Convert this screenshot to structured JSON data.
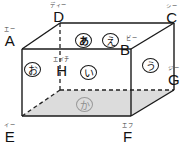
{
  "figure": {
    "kind": "rectangular-cuboid-diagram",
    "shape_name": "cuboid",
    "colors": {
      "stroke": "#1a1a1a",
      "hidden_stroke": "#222222",
      "bottom_face_fill": "#dcdcdc",
      "faint_stroke": "#9a9a9a",
      "background": "#ffffff"
    }
  },
  "vertices": [
    {
      "id": "A",
      "letter": "A",
      "furigana": "エー",
      "x": 16,
      "y": 27
    },
    {
      "id": "B",
      "letter": "B",
      "furigana": "ビー",
      "x": 124,
      "y": 36
    },
    {
      "id": "C",
      "letter": "C",
      "furigana": "シー",
      "x": 168,
      "y": 6
    },
    {
      "id": "D",
      "letter": "D",
      "furigana": "ディー",
      "x": 50,
      "y": 3
    },
    {
      "id": "E",
      "letter": "E",
      "furigana": "イー",
      "x": 14,
      "y": 124
    },
    {
      "id": "F",
      "letter": "F",
      "furigana": "エフ",
      "x": 124,
      "y": 124
    },
    {
      "id": "G",
      "letter": "G",
      "furigana": "ジー",
      "x": 168,
      "y": 67
    },
    {
      "id": "H",
      "letter": "H",
      "furigana": "エイチ",
      "x": 55,
      "y": 61
    }
  ],
  "face_marks": [
    {
      "id": "mark-a",
      "char": "あ",
      "face": "top",
      "x": 75,
      "y": 33,
      "style": "bold"
    },
    {
      "id": "mark-e",
      "char": "え",
      "face": "top",
      "x": 102,
      "y": 33,
      "style": "normal"
    },
    {
      "id": "mark-o",
      "char": "お",
      "face": "left",
      "x": 24,
      "y": 62,
      "style": "normal"
    },
    {
      "id": "mark-i",
      "char": "い",
      "face": "front",
      "x": 80,
      "y": 65,
      "style": "normal"
    },
    {
      "id": "mark-u",
      "char": "う",
      "face": "right",
      "x": 142,
      "y": 58,
      "style": "normal"
    },
    {
      "id": "mark-ka",
      "char": "か",
      "face": "bottom",
      "x": 76,
      "y": 97,
      "style": "faint"
    }
  ],
  "geometry": {
    "front_face": "A-B-F-E",
    "top_face": "A-B-C-D",
    "right_face": "B-C-G-F",
    "bottom_face": "E-F-G-H",
    "hidden_vertex": "H",
    "points": {
      "A": [
        22,
        49
      ],
      "B": [
        131,
        49
      ],
      "C": [
        174,
        23
      ],
      "D": [
        60,
        23
      ],
      "E": [
        22,
        116
      ],
      "F": [
        131,
        116
      ],
      "G": [
        174,
        90
      ],
      "H": [
        60,
        90
      ]
    }
  }
}
